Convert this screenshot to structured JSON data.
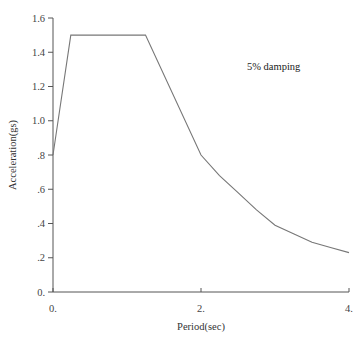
{
  "chart_data": {
    "type": "line",
    "title": "",
    "xlabel": "Period(sec)",
    "ylabel": "Acceleration(gs)",
    "xlim": [
      0,
      4
    ],
    "ylim": [
      0,
      1.6
    ],
    "grid": false,
    "legend": null,
    "annotations": [
      {
        "text": "5% damping",
        "x": 3.0,
        "y": 1.32
      }
    ],
    "x_ticks": [
      {
        "value": 0,
        "label": "0."
      },
      {
        "value": 2,
        "label": "2."
      },
      {
        "value": 4,
        "label": "4."
      }
    ],
    "y_ticks": [
      {
        "value": 0.0,
        "label": "0."
      },
      {
        "value": 0.2,
        "label": ".2"
      },
      {
        "value": 0.4,
        "label": ".4"
      },
      {
        "value": 0.6,
        "label": ".6"
      },
      {
        "value": 0.8,
        "label": ".8"
      },
      {
        "value": 1.0,
        "label": "1.0"
      },
      {
        "value": 1.2,
        "label": "1.2"
      },
      {
        "value": 1.4,
        "label": "1.4"
      },
      {
        "value": 1.6,
        "label": "1.6"
      }
    ],
    "series": [
      {
        "name": "Response spectrum (5% damping)",
        "x": [
          0.0,
          0.24,
          1.25,
          2.0,
          2.25,
          2.5,
          2.75,
          3.0,
          3.25,
          3.5,
          3.75,
          4.0
        ],
        "y": [
          0.8,
          1.5,
          1.5,
          0.8,
          0.68,
          0.58,
          0.48,
          0.39,
          0.34,
          0.29,
          0.26,
          0.23
        ]
      }
    ]
  },
  "colors": {
    "axis": "#555555",
    "line": "#777777",
    "text": "#333333"
  }
}
